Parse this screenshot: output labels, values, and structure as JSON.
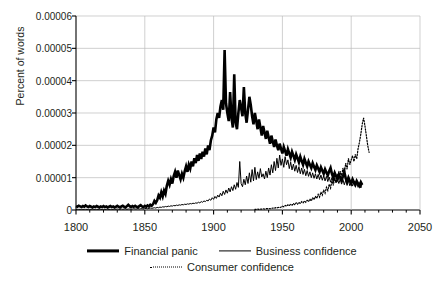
{
  "chart_data": {
    "type": "line",
    "title": "",
    "xlabel": "",
    "ylabel": "Percent of words",
    "xlim": [
      1800,
      2050
    ],
    "ylim": [
      0,
      6e-05
    ],
    "grid": true,
    "legend_position": "bottom",
    "x_ticks": [
      "1800",
      "1850",
      "1900",
      "1950",
      "2000",
      "2050"
    ],
    "x_tick_values": [
      1800,
      1850,
      1900,
      1950,
      2000,
      2050
    ],
    "x_minor_tick_step": 10,
    "y_ticks": [
      "0",
      "0.00001",
      "0.00002",
      "0.00003",
      "0.00004",
      "0.00005",
      "0.00006"
    ],
    "y_tick_values": [
      0,
      1e-05,
      2e-05,
      3e-05,
      4e-05,
      5e-05,
      6e-05
    ],
    "colors": {
      "ink": "#000000",
      "grid": "#bcbcbc",
      "axis": "#000000",
      "text": "#231f20"
    },
    "series": [
      {
        "name": "Financial panic",
        "style": "solid",
        "width": 2.6,
        "x_start": 1800,
        "x_step": 1,
        "values": [
          1.2e-06,
          1e-06,
          1.3e-06,
          1.1e-06,
          9e-07,
          1.2e-06,
          1e-06,
          1.4e-06,
          1.1e-06,
          9e-07,
          1.2e-06,
          1e-06,
          8e-07,
          1.1e-06,
          9e-07,
          1.2e-06,
          1e-06,
          8e-07,
          1.1e-06,
          9e-07,
          1.2e-06,
          9e-07,
          1.1e-06,
          8e-07,
          1e-06,
          1.2e-06,
          9e-07,
          1.1e-06,
          8e-07,
          1e-06,
          1.3e-06,
          1e-06,
          8e-07,
          1.1e-06,
          1.3e-06,
          1e-06,
          8e-07,
          1.2e-06,
          1.6e-06,
          1.2e-06,
          9e-07,
          1.2e-06,
          1e-06,
          1.3e-06,
          1e-06,
          8e-07,
          1.2e-06,
          1.5e-06,
          1.1e-06,
          9e-07,
          1.3e-06,
          1e-06,
          1.4e-06,
          1.1e-06,
          1.6e-06,
          1.3e-06,
          1.8e-06,
          2.8e-06,
          2.2e-06,
          3e-06,
          4.5e-06,
          3.8e-06,
          5.5e-06,
          4.2e-06,
          6e-06,
          5e-06,
          7.5e-06,
          9e-06,
          7.8e-06,
          9.5e-06,
          8.2e-06,
          1.05e-05,
          1.18e-05,
          1e-05,
          1.22e-05,
          1.08e-05,
          9.5e-06,
          1.12e-05,
          1e-05,
          1.2e-05,
          1.35e-05,
          1.18e-05,
          1.4e-05,
          1.28e-05,
          1.5e-05,
          1.35e-05,
          1.6e-05,
          1.45e-05,
          1.7e-05,
          1.52e-05,
          1.75e-05,
          1.58e-05,
          1.8e-05,
          1.65e-05,
          1.9e-05,
          1.72e-05,
          2e-05,
          1.85e-05,
          2.15e-05,
          2.3e-05,
          2.55e-05,
          2.4e-05,
          2.8e-05,
          3e-05,
          2.85e-05,
          3.2e-05,
          3.4e-05,
          3.1e-05,
          4.95e-05,
          3.3e-05,
          3e-05,
          2.75e-05,
          3.65e-05,
          2.85e-05,
          2.55e-05,
          4.2e-05,
          2.7e-05,
          2.5e-05,
          3e-05,
          3.4e-05,
          3.15e-05,
          2.9e-05,
          3.8e-05,
          3e-05,
          2.7e-05,
          3.1e-05,
          3.5e-05,
          3.25e-05,
          2.9e-05,
          2.65e-05,
          3e-05,
          2.75e-05,
          2.5e-05,
          2.8e-05,
          2.55e-05,
          2.3e-05,
          2.6e-05,
          2.4e-05,
          2.2e-05,
          2.45e-05,
          2.25e-05,
          2.05e-05,
          2.3e-05,
          2.12e-05,
          1.95e-05,
          2.18e-05,
          2e-05,
          1.85e-05,
          2.05e-05,
          1.9e-05,
          1.75e-05,
          1.95e-05,
          1.82e-05,
          1.68e-05,
          1.88e-05,
          1.75e-05,
          1.62e-05,
          1.8e-05,
          1.68e-05,
          1.55e-05,
          1.72e-05,
          1.6e-05,
          1.48e-05,
          1.65e-05,
          1.52e-05,
          1.4e-05,
          1.58e-05,
          1.46e-05,
          1.35e-05,
          1.5e-05,
          1.4e-05,
          1.3e-05,
          1.45e-05,
          1.34e-05,
          1.24e-05,
          1.38e-05,
          1.28e-05,
          1.18e-05,
          1.32e-05,
          1.22e-05,
          1.12e-05,
          1.26e-05,
          1.16e-05,
          1.07e-05,
          1.2e-05,
          1.3e-05,
          1.12e-05,
          1e-05,
          1.15e-05,
          1.05e-05,
          9.6e-06,
          1.1e-05,
          1e-05,
          9.2e-06,
          1.04e-05,
          1.18e-05,
          9.8e-06,
          8.8e-06,
          1e-05,
          9e-06,
          8.2e-06,
          9.5e-06,
          8.6e-06,
          7.8e-06,
          9e-06,
          8.2e-06,
          7.5e-06,
          8.6e-06,
          7.8e-06
        ]
      },
      {
        "name": "Business confidence",
        "style": "solid",
        "width": 1.0,
        "x_start": 1800,
        "x_step": 1,
        "values": [
          2e-07,
          2e-07,
          2e-07,
          2e-07,
          2e-07,
          2e-07,
          2e-07,
          2e-07,
          2e-07,
          2e-07,
          2e-07,
          2e-07,
          2e-07,
          2e-07,
          2e-07,
          2e-07,
          2e-07,
          2e-07,
          2e-07,
          2e-07,
          2e-07,
          2e-07,
          2e-07,
          2e-07,
          2e-07,
          2e-07,
          2e-07,
          2e-07,
          2e-07,
          2e-07,
          3e-07,
          2e-07,
          2e-07,
          3e-07,
          2e-07,
          3e-07,
          3e-07,
          2e-07,
          3e-07,
          3e-07,
          2e-07,
          3e-07,
          4e-07,
          3e-07,
          3e-07,
          4e-07,
          3e-07,
          4e-07,
          4e-07,
          3e-07,
          4e-07,
          5e-07,
          4e-07,
          5e-07,
          6e-07,
          5e-07,
          6e-07,
          7e-07,
          6e-07,
          8e-07,
          7e-07,
          9e-07,
          8e-07,
          1e-06,
          9e-07,
          1.1e-06,
          1e-06,
          1.2e-06,
          1.1e-06,
          1.3e-06,
          1.2e-06,
          1.4e-06,
          1.3e-06,
          1.5e-06,
          1.4e-06,
          1.6e-06,
          1.5e-06,
          1.7e-06,
          1.6e-06,
          1.8e-06,
          1.7e-06,
          1.9e-06,
          1.8e-06,
          2e-06,
          1.9e-06,
          2.1e-06,
          2e-06,
          2.2e-06,
          2.1e-06,
          2.4e-06,
          2.2e-06,
          2.6e-06,
          2.4e-06,
          2.8e-06,
          2.6e-06,
          3e-06,
          2.8e-06,
          3.4e-06,
          3e-06,
          3.8e-06,
          3.3e-06,
          4.2e-06,
          3.6e-06,
          4.6e-06,
          4e-06,
          5.2e-06,
          4.4e-06,
          5.8e-06,
          4.8e-06,
          6.2e-06,
          5.2e-06,
          6.8e-06,
          5.6e-06,
          7.2e-06,
          6e-06,
          7.8e-06,
          6.4e-06,
          8.5e-06,
          7e-06,
          1.5e-05,
          8.2e-06,
          7.2e-06,
          9.5e-06,
          7.8e-06,
          1.05e-05,
          8.2e-06,
          1.15e-05,
          8.6e-06,
          1.25e-05,
          9e-06,
          1.32e-05,
          9.4e-06,
          1.18e-05,
          9.8e-06,
          1.28e-05,
          1.02e-05,
          1.12e-05,
          9.6e-06,
          1.2e-05,
          1e-05,
          1.3e-05,
          1.08e-05,
          1.4e-05,
          1.15e-05,
          1.5e-05,
          1.22e-05,
          1.6e-05,
          1.3e-05,
          1.7e-05,
          1.38e-05,
          1.58e-05,
          1.32e-05,
          1.65e-05,
          1.4e-05,
          1.55e-05,
          1.28e-05,
          1.48e-05,
          1.24e-05,
          1.42e-05,
          1.2e-05,
          1.38e-05,
          1.16e-05,
          1.34e-05,
          1.12e-05,
          1.3e-05,
          1.1e-05,
          1.26e-05,
          1.06e-05,
          1.22e-05,
          1.04e-05,
          1.18e-05,
          1e-05,
          1.15e-05,
          9.8e-06,
          1.12e-05,
          9.6e-06,
          1.1e-05,
          9.4e-06,
          1.08e-05,
          9.2e-06,
          1.06e-05,
          9e-06,
          1.04e-05,
          8.8e-06,
          1.02e-05,
          8.6e-06,
          1e-05,
          8.5e-06,
          9.8e-06,
          8.4e-06,
          9.6e-06,
          8.2e-06,
          9.5e-06,
          8e-06,
          9.4e-06,
          7.8e-06,
          9.2e-06,
          7.6e-06,
          9e-06,
          7.5e-06,
          8.8e-06,
          7.4e-06,
          8.6e-06,
          7.2e-06,
          8.5e-06,
          7e-06,
          8.4e-06,
          6.8e-06,
          8.2e-06
        ]
      },
      {
        "name": "Consumer confidence",
        "style": "dotted",
        "width": 1.2,
        "x_start": 1930,
        "x_step": 1,
        "values": [
          2e-07,
          2e-07,
          3e-07,
          2e-07,
          3e-07,
          3e-07,
          4e-07,
          3e-07,
          4e-07,
          4e-07,
          5e-07,
          4e-07,
          5e-07,
          6e-07,
          5e-07,
          7e-07,
          6e-07,
          8e-07,
          7e-07,
          9e-07,
          1.2e-06,
          1e-06,
          1.4e-06,
          1.2e-06,
          1.6e-06,
          1.3e-06,
          1.8e-06,
          1.5e-06,
          2e-06,
          1.6e-06,
          2.2e-06,
          1.8e-06,
          2.4e-06,
          2e-06,
          2.6e-06,
          2.2e-06,
          2.8e-06,
          2.4e-06,
          3e-06,
          2.6e-06,
          3.4e-06,
          2.8e-06,
          3.8e-06,
          3.2e-06,
          4.2e-06,
          3.6e-06,
          4.8e-06,
          4e-06,
          5.5e-06,
          4.6e-06,
          6.2e-06,
          5.2e-06,
          7e-06,
          6e-06,
          8e-06,
          6.8e-06,
          9e-06,
          7.6e-06,
          1e-05,
          8.5e-06,
          1.1e-05,
          9.4e-06,
          1.2e-05,
          1.03e-05,
          1.3e-05,
          1.12e-05,
          1.45e-05,
          1.26e-05,
          1.6e-05,
          1.4e-05,
          1.55e-05,
          1.68e-05,
          1.5e-05,
          1.72e-05,
          1.58e-05,
          1.9e-05,
          2.1e-05,
          2.35e-05,
          2.65e-05,
          2.85e-05,
          2.6e-05,
          2.3e-05,
          2e-05,
          1.78e-05
        ]
      }
    ]
  },
  "legend": {
    "rows": [
      [
        {
          "label": "Financial panic",
          "style": "thick"
        },
        {
          "label": "Business confidence",
          "style": "thin"
        }
      ],
      [
        {
          "label": "Consumer confidence",
          "style": "dotted"
        }
      ]
    ]
  }
}
